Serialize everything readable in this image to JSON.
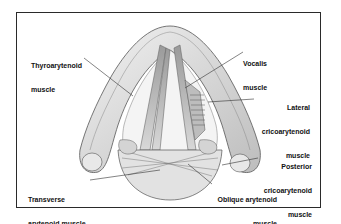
{
  "diagram": {
    "type": "anatomical-illustration",
    "labels": [
      {
        "id": "thyroarytenoid",
        "line1": "Thyroarytenoid",
        "line2": "muscle"
      },
      {
        "id": "vocalis",
        "line1": "Vocalis",
        "line2": "muscle"
      },
      {
        "id": "lateral_cricoarytenoid",
        "line1": "Lateral",
        "line2": "cricoarytenoid",
        "line3": "muscle"
      },
      {
        "id": "posterior_cricoarytenoid",
        "line1": "Posterior",
        "line2": "cricoarytenoid",
        "line3": "muscle"
      },
      {
        "id": "transverse_arytenoid",
        "line1": "Transverse",
        "line2": "arytenoid muscle"
      },
      {
        "id": "oblique_arytenoid",
        "line1": "Oblique arytenoid",
        "line2": "muscle"
      }
    ],
    "colors": {
      "frame": "#2a2a2a",
      "ink": "#555555",
      "shade": "#cfcfcf",
      "paper": "#ffffff"
    }
  }
}
